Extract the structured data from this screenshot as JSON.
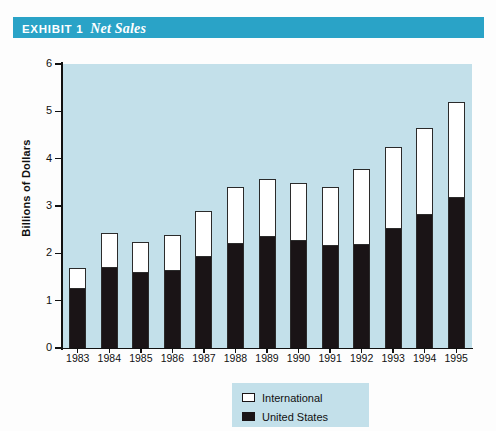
{
  "banner": {
    "exhibit_label": "EXHIBIT 1",
    "exhibit_title": "Net Sales",
    "background_color": "#2aa3c7",
    "text_color": "#ffffff"
  },
  "legend": {
    "entries": [
      {
        "label": "International",
        "swatch": "white-square-icon",
        "color": "#ffffff"
      },
      {
        "label": "United States",
        "swatch": "black-square-icon",
        "color": "#1a1416"
      }
    ],
    "position": "bottom-right",
    "background_color": "#c3e0ea"
  },
  "chart_data": {
    "type": "bar",
    "stacked": true,
    "title": "Net Sales",
    "xlabel": "",
    "ylabel": "Billions of Dollars",
    "ylim": [
      0,
      6
    ],
    "yticks": [
      0,
      1,
      2,
      3,
      4,
      5,
      6
    ],
    "ytick_labels": [
      "0",
      "1",
      "2",
      "3",
      "4",
      "5",
      "6"
    ],
    "grid": false,
    "plot_background_color": "#c3e0ea",
    "categories": [
      "1983",
      "1984",
      "1985",
      "1986",
      "1987",
      "1988",
      "1989",
      "1990",
      "1991",
      "1992",
      "1993",
      "1994",
      "1995"
    ],
    "series": [
      {
        "name": "United States",
        "color": "#1a1416",
        "values": [
          1.25,
          1.68,
          1.58,
          1.62,
          1.92,
          2.2,
          2.35,
          2.27,
          2.15,
          2.18,
          2.52,
          2.8,
          3.17
        ]
      },
      {
        "name": "International",
        "color": "#ffffff",
        "values": [
          0.45,
          0.74,
          0.66,
          0.76,
          0.98,
          1.2,
          1.23,
          1.21,
          1.25,
          1.6,
          1.73,
          1.85,
          2.03
        ]
      }
    ],
    "totals": [
      1.7,
      2.42,
      2.24,
      2.38,
      2.9,
      3.4,
      3.58,
      3.48,
      3.4,
      3.78,
      4.25,
      4.65,
      5.2
    ]
  }
}
